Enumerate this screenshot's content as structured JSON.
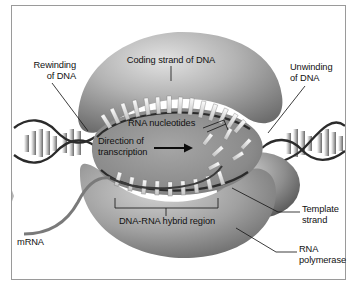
{
  "figure": {
    "border_color": "#9a9a9a",
    "background": "#ffffff"
  },
  "labels": {
    "coding_strand": "Coding strand of DNA",
    "rewinding": "Rewinding\nof DNA",
    "unwinding": "Unwinding\nof DNA",
    "rna_nucleotides": "RNA nucleotides",
    "direction": "Direction of\ntranscription",
    "hybrid_region": "DNA-RNA hybrid region",
    "template_strand": "Template\nstrand",
    "rna_polymerase": "RNA\npolymerase",
    "mrna": "mRNA"
  },
  "colors": {
    "polymerase_light": "#d8d8d8",
    "polymerase_mid": "#9d9d9d",
    "polymerase_dark": "#5e5e5e",
    "cavity": "#8e8e8e",
    "strand_dark": "#2b2b2b",
    "nucleotide_light": "#f2f2f2",
    "leader_line": "#1a1a1a",
    "marker_arrow": "#b5b5b5",
    "text": "#111111"
  },
  "elements": {
    "direction_arrow": "right-arrow",
    "left_helix": "dna-double-helix",
    "right_helix": "dna-double-helix",
    "side_marker": "gray-arrowhead-marker"
  }
}
